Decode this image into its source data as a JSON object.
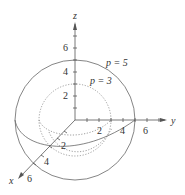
{
  "diagram": {
    "axes": {
      "z": {
        "label": "z",
        "ticks": [
          "2",
          "4",
          "6"
        ]
      },
      "y": {
        "label": "y",
        "ticks": [
          "2",
          "4",
          "6"
        ]
      },
      "x": {
        "label": "x",
        "ticks": [
          "2",
          "4",
          "6"
        ]
      }
    },
    "surfaces": [
      {
        "name": "outer-sphere",
        "label": "p = 5",
        "radius": 5,
        "style": "solid"
      },
      {
        "name": "inner-sphere",
        "label": "p = 3",
        "radius": 3,
        "style": "dotted"
      }
    ],
    "colors": {
      "stroke": "#555555",
      "text": "#333333",
      "background": "#ffffff"
    }
  }
}
